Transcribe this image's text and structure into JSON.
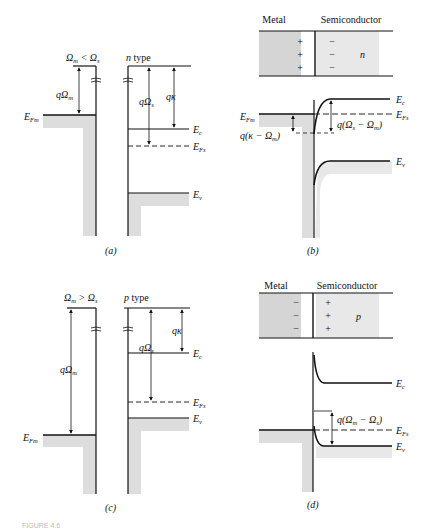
{
  "figure": {
    "title_partial": "FIGURE 4.6",
    "panels": [
      {
        "id": "a",
        "caption": "(a)",
        "metal_header": "Ωm < Ωs",
        "semi_header": "n type",
        "labels": {
          "q_omega_m": "qΩm",
          "q_omega_s": "qΩs",
          "q_chi": "qκ",
          "E_Fm": "EFm",
          "E_c": "Ec",
          "E_Fs": "EFs",
          "E_v": "Ev"
        }
      },
      {
        "id": "b",
        "caption": "(b)",
        "metal_label": "Metal",
        "semi_label": "Semiconductor",
        "metal_charges": [
          "+",
          "+",
          "+"
        ],
        "semi_charges": [
          "−",
          "−",
          "−"
        ],
        "semi_type": "n",
        "labels": {
          "E_Fm": "EFm",
          "barrier": "q(κ − Ωm)",
          "built_in": "q(Ωs − Ωm)",
          "E_c": "Ec",
          "E_Fs": "EFs",
          "E_v": "Ev"
        }
      },
      {
        "id": "c",
        "caption": "(c)",
        "metal_header": "Ωm > Ωs",
        "semi_header": "p type",
        "labels": {
          "q_omega_m": "qΩm",
          "q_omega_s": "qΩs",
          "q_chi": "qκ",
          "E_Fm": "EFm",
          "E_c": "Ec",
          "E_Fs": "EFs",
          "E_v": "Ev"
        }
      },
      {
        "id": "d",
        "caption": "(d)",
        "metal_label": "Metal",
        "semi_label": "Semiconductor",
        "metal_charges": [
          "−",
          "−",
          "−"
        ],
        "semi_charges": [
          "+",
          "+",
          "+"
        ],
        "semi_type": "p",
        "labels": {
          "built_in": "q(Ωm − Ωs)",
          "E_c": "Ec",
          "E_Fs": "EFs",
          "E_v": "Ev"
        }
      }
    ]
  }
}
